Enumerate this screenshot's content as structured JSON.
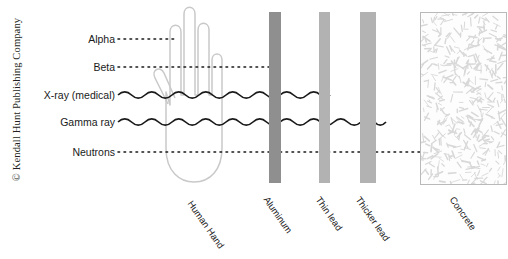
{
  "figure": {
    "copyright": "© Kendall Hunt Publishing Company"
  },
  "rays": [
    {
      "name": "alpha",
      "label": "Alpha",
      "style": "dotted",
      "y": 39,
      "start_x": 118,
      "end_x": 176,
      "stopped_by": "Human Hand"
    },
    {
      "name": "beta",
      "label": "Beta",
      "style": "dotted",
      "y": 67,
      "start_x": 118,
      "end_x": 272,
      "stopped_by": "Aluminum"
    },
    {
      "name": "xray",
      "label": "X-ray (medical)",
      "style": "wave",
      "y": 95,
      "start_x": 118,
      "end_x": 330,
      "stopped_by": "Thin lead"
    },
    {
      "name": "gamma",
      "label": "Gamma ray",
      "style": "wave",
      "y": 122,
      "start_x": 118,
      "end_x": 386,
      "stopped_by": "Thicker lead"
    },
    {
      "name": "neutron",
      "label": "Neutrons",
      "style": "dotted",
      "y": 152,
      "start_x": 118,
      "end_x": 466,
      "stopped_by": "Concrete"
    }
  ],
  "barriers": [
    {
      "name": "human-hand",
      "label": "Human Hand",
      "x": 150,
      "y": 10,
      "width": 76,
      "height": 175,
      "kind": "hand",
      "color": "#c9c9c9",
      "label_x": 190,
      "label_y": 196
    },
    {
      "name": "aluminum",
      "label": "Aluminum",
      "x": 269,
      "y": 12,
      "width": 12,
      "height": 171,
      "kind": "slab",
      "color": "#8f8f8f",
      "label_x": 266,
      "label_y": 192
    },
    {
      "name": "thin-lead",
      "label": "Thin lead",
      "x": 319,
      "y": 12,
      "width": 11,
      "height": 171,
      "kind": "slab",
      "color": "#b2b2b2",
      "label_x": 318,
      "label_y": 192
    },
    {
      "name": "thicker-lead",
      "label": "Thicker lead",
      "x": 360,
      "y": 12,
      "width": 16,
      "height": 171,
      "kind": "slab",
      "color": "#b2b2b2",
      "label_x": 358,
      "label_y": 192
    },
    {
      "name": "concrete",
      "label": "Concrete",
      "x": 420,
      "y": 12,
      "width": 85,
      "height": 171,
      "kind": "concrete",
      "color": "#d8d8d8",
      "label_x": 452,
      "label_y": 192
    }
  ],
  "style": {
    "ray_color": "#1a1a1a",
    "hand_color": "#c9c9c9",
    "concrete_border": "#b9b9b9",
    "text_color": "#1a1a1a",
    "background": "#ffffff"
  }
}
